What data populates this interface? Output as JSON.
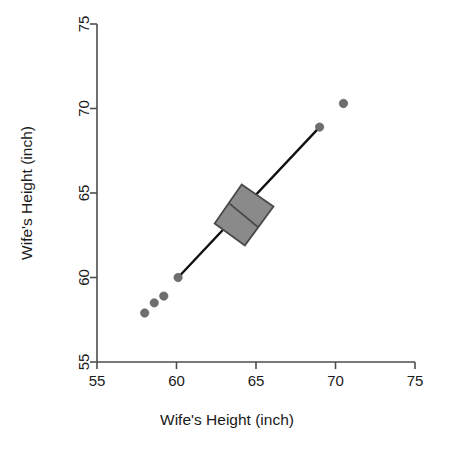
{
  "chart_data": {
    "type": "scatter",
    "title": "",
    "xlabel": "Wife's Height (inch)",
    "ylabel": "Wife's Height (inch)",
    "xlim": [
      55,
      75
    ],
    "ylim": [
      55,
      75
    ],
    "xticks": [
      55,
      60,
      65,
      70,
      75
    ],
    "yticks": [
      55,
      60,
      65,
      70,
      75
    ],
    "xtick_labels": [
      "55",
      "60",
      "65",
      "70",
      "75"
    ],
    "ytick_labels": [
      "55",
      "60",
      "65",
      "70",
      "75"
    ],
    "grid": false,
    "legend": null,
    "series": [
      {
        "name": "outlier points",
        "marker": "filled-circle",
        "color": "#6e6e6e",
        "points": [
          {
            "x": 58.0,
            "y": 57.9
          },
          {
            "x": 58.6,
            "y": 58.5
          },
          {
            "x": 59.2,
            "y": 58.9
          },
          {
            "x": 60.1,
            "y": 60.0
          },
          {
            "x": 69.0,
            "y": 68.9
          },
          {
            "x": 70.5,
            "y": 70.3
          }
        ]
      },
      {
        "name": "whisker line",
        "marker": "line",
        "color": "#111111",
        "points": [
          {
            "x": 60.1,
            "y": 60.0
          },
          {
            "x": 69.0,
            "y": 68.9
          }
        ]
      }
    ],
    "box": {
      "name": "rotated interquartile box",
      "fill": "#8a8a8a",
      "stroke": "#4a4a4a",
      "corners": [
        {
          "x": 62.4,
          "y": 63.2
        },
        {
          "x": 64.1,
          "y": 65.5
        },
        {
          "x": 66.1,
          "y": 64.2
        },
        {
          "x": 64.3,
          "y": 61.9
        }
      ],
      "median_from": {
        "x": 63.3,
        "y": 64.4
      },
      "median_to": {
        "x": 65.1,
        "y": 63.0
      }
    }
  },
  "axes": {
    "x_title": "Wife's Height (inch)",
    "y_title": "Wife's Height (inch)"
  }
}
